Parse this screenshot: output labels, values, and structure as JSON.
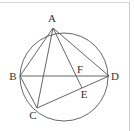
{
  "figure": {
    "type": "geometry",
    "stroke_color": "#555555",
    "circle": {
      "cx": 64,
      "cy": 77,
      "r": 44
    },
    "points": {
      "A": {
        "label": "A",
        "x": 53,
        "y": 28,
        "lx": 52,
        "ly": 22
      },
      "B": {
        "label": "B",
        "x": 20,
        "y": 76,
        "lx": 13,
        "ly": 80
      },
      "C": {
        "label": "C",
        "x": 37,
        "y": 108,
        "lx": 33,
        "ly": 119
      },
      "D": {
        "label": "D",
        "x": 109,
        "y": 76,
        "lx": 115,
        "ly": 80
      },
      "E": {
        "label": "E",
        "x": 82,
        "y": 88,
        "lx": 84,
        "ly": 98
      },
      "F": {
        "label": "F",
        "x": 78,
        "y": 76,
        "lx": 80,
        "ly": 73
      }
    },
    "segments": [
      [
        "A",
        "B"
      ],
      [
        "A",
        "C"
      ],
      [
        "A",
        "D"
      ],
      [
        "A",
        "E"
      ],
      [
        "B",
        "D"
      ],
      [
        "B",
        "C"
      ],
      [
        "C",
        "D"
      ]
    ]
  }
}
